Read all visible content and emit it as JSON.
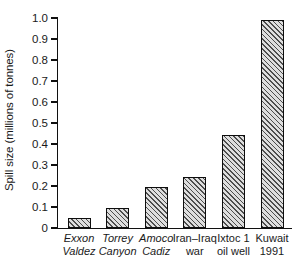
{
  "chart_data": {
    "type": "bar",
    "title": "",
    "xlabel": "",
    "ylabel": "Spill size (millions of tonnes)",
    "ylim": [
      0,
      1.0
    ],
    "grid": false,
    "legend": null,
    "categories": [
      "Exxon Valdez",
      "Torrey Canyon",
      "Amoco Cadiz",
      "Iran–Iraq war",
      "Ixtoc 1 oil well",
      "Kuwait 1991"
    ],
    "values": [
      0.05,
      0.095,
      0.195,
      0.245,
      0.445,
      0.99
    ],
    "ytick_labels": [
      "0",
      "0.1",
      "0.2",
      "0.3",
      "0.4",
      "0.5",
      "0.6",
      "0.7",
      "0.8",
      "0.9",
      "1.0"
    ],
    "ytick_values": [
      0,
      0.1,
      0.2,
      0.3,
      0.4,
      0.5,
      0.6,
      0.7,
      0.8,
      0.9,
      1.0
    ]
  },
  "axis": {
    "y_title": "Spill size (millions of tonnes)",
    "ticks": [
      {
        "label": "1.0",
        "value": 1.0
      },
      {
        "label": "0.9",
        "value": 0.9
      },
      {
        "label": "0.8",
        "value": 0.8
      },
      {
        "label": "0.7",
        "value": 0.7
      },
      {
        "label": "0.6",
        "value": 0.6
      },
      {
        "label": "0.5",
        "value": 0.5
      },
      {
        "label": "0.4",
        "value": 0.4
      },
      {
        "label": "0.3",
        "value": 0.3
      },
      {
        "label": "0.2",
        "value": 0.2
      },
      {
        "label": "0.1",
        "value": 0.1
      },
      {
        "label": "0",
        "value": 0
      }
    ]
  },
  "bars": [
    {
      "name": "exxon-valdez",
      "line1": "Exxon",
      "line2": "Valdez",
      "value": 0.05,
      "italic": true
    },
    {
      "name": "torrey-canyon",
      "line1": "Torrey",
      "line2": "Canyon",
      "value": 0.095,
      "italic": true
    },
    {
      "name": "amoco-cadiz",
      "line1": "Amoco",
      "line2": "Cadiz",
      "value": 0.195,
      "italic": true
    },
    {
      "name": "iran-iraq-war",
      "line1": "Iran–Iraq",
      "line2": "war",
      "value": 0.245,
      "italic": false
    },
    {
      "name": "ixtoc-1",
      "line1": "Ixtoc 1",
      "line2": "oil well",
      "value": 0.445,
      "italic": false
    },
    {
      "name": "kuwait-1991",
      "line1": "Kuwait",
      "line2": "1991",
      "value": 0.99,
      "italic": false
    }
  ],
  "colors": {
    "axis": "#101010",
    "bar_edge": "#0d0d0d",
    "bar_fill": "#dedede",
    "hatch": "#4d4d4d",
    "text": "#1a1a1a",
    "background": "#ffffff"
  }
}
